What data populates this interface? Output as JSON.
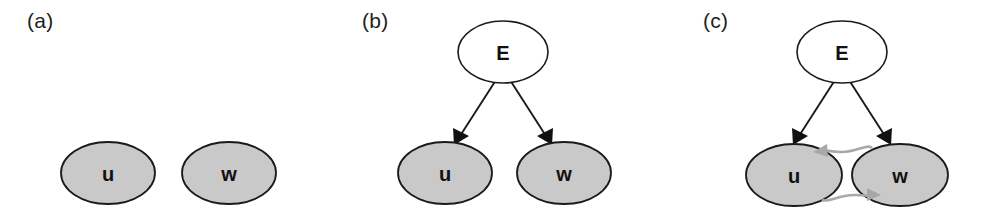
{
  "figure": {
    "background_color": "#ffffff",
    "width": 992,
    "height": 216,
    "panel_count": 3
  },
  "colors": {
    "node_observed_fill": "#c9c9c9",
    "node_latent_fill": "#ffffff",
    "node_stroke": "#1a1a1a",
    "causal_arrow": "#1a1a1a",
    "association_arrow": "#a8a8a8",
    "label_text": "#231f20"
  },
  "panels": [
    {
      "label": "(a)",
      "nodes": [
        {
          "id": "u",
          "label": "u",
          "style": "gray"
        },
        {
          "id": "w",
          "label": "w",
          "style": "gray"
        }
      ],
      "edges": []
    },
    {
      "label": "(b)",
      "nodes": [
        {
          "id": "E",
          "label": "E",
          "style": "white"
        },
        {
          "id": "u",
          "label": "u",
          "style": "gray"
        },
        {
          "id": "w",
          "label": "w",
          "style": "gray"
        }
      ],
      "edges": [
        {
          "from": "E",
          "to": "u",
          "style": "causal",
          "color": "#1a1a1a",
          "arrow": "single"
        },
        {
          "from": "E",
          "to": "w",
          "style": "causal",
          "color": "#1a1a1a",
          "arrow": "single"
        }
      ]
    },
    {
      "label": "(c)",
      "nodes": [
        {
          "id": "E",
          "label": "E",
          "style": "white"
        },
        {
          "id": "u",
          "label": "u",
          "style": "gray"
        },
        {
          "id": "w",
          "label": "w",
          "style": "gray"
        }
      ],
      "edges": [
        {
          "from": "E",
          "to": "u",
          "style": "causal",
          "color": "#1a1a1a",
          "arrow": "single"
        },
        {
          "from": "E",
          "to": "w",
          "style": "causal",
          "color": "#1a1a1a",
          "arrow": "single"
        },
        {
          "from": "w",
          "to": "u",
          "style": "association-arc-top",
          "color": "#a8a8a8",
          "arrow": "single"
        },
        {
          "from": "u",
          "to": "w",
          "style": "association-arc-bottom",
          "color": "#a8a8a8",
          "arrow": "single"
        }
      ]
    }
  ]
}
